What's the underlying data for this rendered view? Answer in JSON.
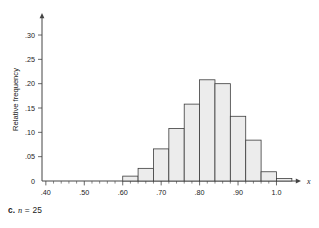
{
  "figure": {
    "caption_letter": "c.",
    "caption_variable": "n",
    "caption_equals": "=",
    "caption_value": "25",
    "y_axis_title": "Relative frequency",
    "x_axis_variable": "x"
  },
  "colors": {
    "bar_fill": "#ececec",
    "bar_stroke": "#3c3c3c",
    "axis": "#444444",
    "text": "#1a1a1a",
    "background": "#ffffff"
  },
  "chart_data": {
    "type": "bar",
    "title": "",
    "subtitle": "",
    "xlabel": "x",
    "ylabel": "Relative frequency",
    "grid": false,
    "legend": false,
    "xlim": [
      0.39,
      1.03
    ],
    "ylim": [
      0,
      0.335
    ],
    "bar_width": 0.04,
    "xticks": [
      0.4,
      0.5,
      0.6,
      0.7,
      0.8,
      0.9,
      1.0
    ],
    "xtick_labels": [
      ".40",
      ".50",
      ".60",
      ".70",
      ".80",
      ".90",
      "1.0"
    ],
    "x_minor_tick_step": 0.02,
    "yticks": [
      0,
      0.05,
      0.1,
      0.15,
      0.2,
      0.25,
      0.3
    ],
    "ytick_labels": [
      "0",
      ".05",
      ".10",
      ".15",
      ".20",
      ".25",
      ".30"
    ],
    "bin_left_edges": [
      0.6,
      0.64,
      0.68,
      0.72,
      0.76,
      0.8,
      0.84,
      0.88,
      0.92,
      0.96,
      1.0
    ],
    "categories": [
      "0.60-0.64",
      "0.64-0.68",
      "0.68-0.72",
      "0.72-0.76",
      "0.76-0.80",
      "0.80-0.84",
      "0.84-0.88",
      "0.88-0.92",
      "0.92-0.96",
      "0.96-1.00",
      "1.00-1.02"
    ],
    "values": [
      0.01,
      0.026,
      0.066,
      0.108,
      0.158,
      0.208,
      0.2,
      0.133,
      0.084,
      0.019,
      0.005
    ]
  }
}
